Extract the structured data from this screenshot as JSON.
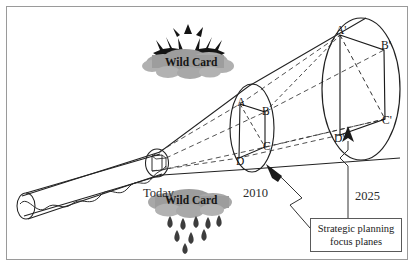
{
  "diagram": {
    "frame": {
      "border_color": "#9a9a9a"
    },
    "timeline_labels": [
      {
        "id": "today",
        "text": "Today",
        "x": 143,
        "y": 186
      },
      {
        "id": "2010",
        "text": "2010",
        "x": 243,
        "y": 186
      },
      {
        "id": "2025",
        "text": "2025",
        "x": 355,
        "y": 189
      }
    ],
    "near_plane": {
      "name": "today-plane",
      "vertices": []
    },
    "mid_plane": {
      "name": "2010-plane",
      "vertices": [
        {
          "label": "A",
          "x": 240,
          "y": 101
        },
        {
          "label": "B",
          "x": 265,
          "y": 110
        },
        {
          "label": "C",
          "x": 266,
          "y": 148
        },
        {
          "label": "D",
          "x": 239,
          "y": 160
        }
      ]
    },
    "far_plane": {
      "name": "2025-plane",
      "vertices": [
        {
          "label": "A'",
          "x": 342,
          "y": 32
        },
        {
          "label": "B'",
          "x": 385,
          "y": 48
        },
        {
          "label": "C'",
          "x": 386,
          "y": 120
        },
        {
          "label": "D'",
          "x": 341,
          "y": 138
        }
      ]
    },
    "wild_cards": [
      {
        "id": "wild-card-top",
        "text": "Wild Card",
        "icon": "sunburst-icon",
        "x": 189,
        "y": 58
      },
      {
        "id": "wild-card-bottom",
        "text": "Wild Card",
        "icon": "rain-cloud-icon",
        "x": 189,
        "y": 199
      }
    ],
    "callout": {
      "name": "strategic-planning-focus-planes-callout",
      "line1": "Strategic planning",
      "line2": "focus planes"
    },
    "colors": {
      "cloud_fill": "#a3a3a3",
      "cloud_fill_light": "#b5b5b5",
      "stroke": "#222222",
      "dashed": "#3a3a3a",
      "frame": "#9a9a9a",
      "raindrop": "#4a4a4a"
    }
  }
}
